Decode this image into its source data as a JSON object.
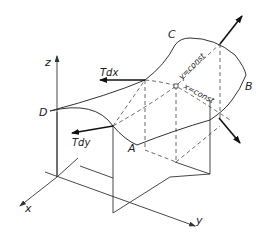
{
  "figure": {
    "axes": {
      "x": "x",
      "y": "y",
      "z": "z"
    },
    "corners": {
      "A": "A",
      "B": "B",
      "C": "C",
      "D": "D"
    },
    "forces": {
      "tdx": "Tdx",
      "tdy": "Tdy"
    },
    "curves": {
      "y_const": "y=const",
      "x_const": "x=const"
    },
    "colors": {
      "line": "#333333",
      "arrow": "#111111",
      "background": "#ffffff"
    }
  }
}
